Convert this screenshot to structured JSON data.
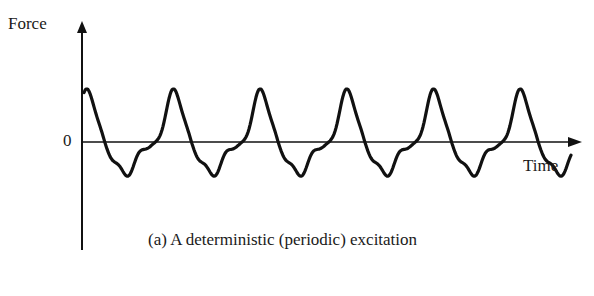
{
  "figure": {
    "y_axis_label": "Force",
    "x_axis_label": "Time",
    "zero_label": "0",
    "caption": "(a) A deterministic (periodic) excitation"
  },
  "chart_data": {
    "type": "line",
    "title": "(a) A deterministic (periodic) excitation",
    "xlabel": "Time",
    "ylabel": "Force",
    "y_ticks": [
      "0"
    ],
    "grid": false,
    "legend": null,
    "series": [
      {
        "name": "Force",
        "period_relative": 1.0,
        "cycles_shown": 5.5,
        "amplitude_positive": 1.0,
        "amplitude_negative": -0.67
      }
    ],
    "colors": {
      "line": "#111111",
      "axis": "#111111",
      "background": "#ffffff"
    }
  }
}
